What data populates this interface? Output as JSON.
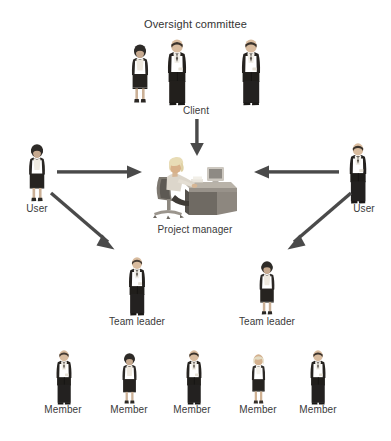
{
  "diagram": {
    "title": "Oversight committee",
    "background_color": "#ffffff",
    "text_color": "#3a3a3a",
    "arrow_color": "#4a4a4a",
    "nodes": {
      "oversight_committee": {
        "label": "Oversight committee",
        "members": [
          {
            "id": "oc-1",
            "figure": "woman-dark-suit"
          },
          {
            "id": "oc-2",
            "figure": "man-dark-suit"
          },
          {
            "id": "oc-3",
            "figure": "woman-light-suit"
          },
          {
            "id": "oc-4",
            "figure": "man-dark-suit"
          }
        ]
      },
      "client": {
        "label": "Client"
      },
      "user_left": {
        "label": "User",
        "figure": "woman-dark-suit"
      },
      "user_right": {
        "label": "User",
        "figure": "man-dark-suit"
      },
      "project_manager": {
        "label": "Project manager",
        "figure": "woman-at-desk"
      },
      "team_leader_left": {
        "label": "Team leader",
        "figure": "man-dark-suit"
      },
      "team_leader_right": {
        "label": "Team leader",
        "figure": "woman-dark-suit"
      },
      "members": [
        {
          "label": "Member",
          "figure": "man-dark-suit"
        },
        {
          "label": "Member",
          "figure": "woman-dark-suit"
        },
        {
          "label": "Member",
          "figure": "man-dark-suit"
        },
        {
          "label": "Member",
          "figure": "woman-light-hair"
        },
        {
          "label": "Member",
          "figure": "man-dark-suit"
        }
      ]
    },
    "arrows": [
      {
        "id": "client-to-pm",
        "from": "client",
        "to": "project_manager",
        "direction": "down"
      },
      {
        "id": "user-left-to-pm",
        "from": "user_left",
        "to": "project_manager",
        "direction": "right"
      },
      {
        "id": "user-right-to-pm",
        "from": "user_right",
        "to": "project_manager",
        "direction": "left"
      },
      {
        "id": "user-left-to-team-leader-left",
        "from": "user_left",
        "to": "team_leader_left",
        "direction": "down-right"
      },
      {
        "id": "user-right-to-team-leader-right",
        "from": "user_right",
        "to": "team_leader_right",
        "direction": "down-left"
      }
    ]
  }
}
